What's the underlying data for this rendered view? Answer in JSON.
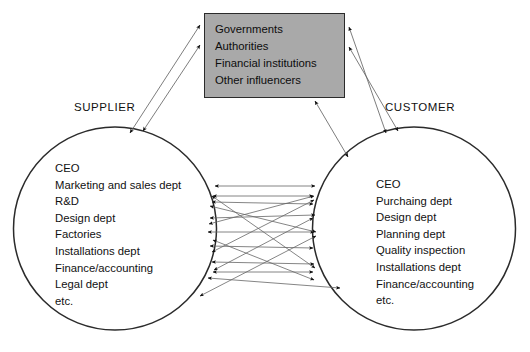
{
  "diagram": {
    "colors": {
      "box_fill": "#a9a9a9",
      "box_border": "#2b2b2b",
      "circle_stroke": "#2b2b2b",
      "arrow_stroke": "#555555",
      "arrowhead_fill": "#111111",
      "text": "#111111",
      "background": "#ffffff"
    },
    "supplier": {
      "label": "SUPPLIER",
      "items": [
        "CEO",
        "Marketing and sales dept",
        "R&D",
        "Design dept",
        "Factories",
        "Installations dept",
        "Finance/accounting",
        "Legal dept",
        "etc."
      ]
    },
    "customer": {
      "label": "CUSTOMER",
      "items": [
        "CEO",
        "Purchaing dept",
        "Design dept",
        "Planning dept",
        "Quality inspection",
        "Installations dept",
        "Finance/accounting",
        "etc."
      ]
    },
    "influencers": {
      "items": [
        "Governments",
        "Authorities",
        "Financial institutions",
        "Other influencers"
      ]
    },
    "connectors": {
      "supplier_to_influencers_count": 2,
      "customer_to_influencers_count": 3,
      "supplier_to_customer_count": 11,
      "arrow_style": "double-headed"
    }
  }
}
